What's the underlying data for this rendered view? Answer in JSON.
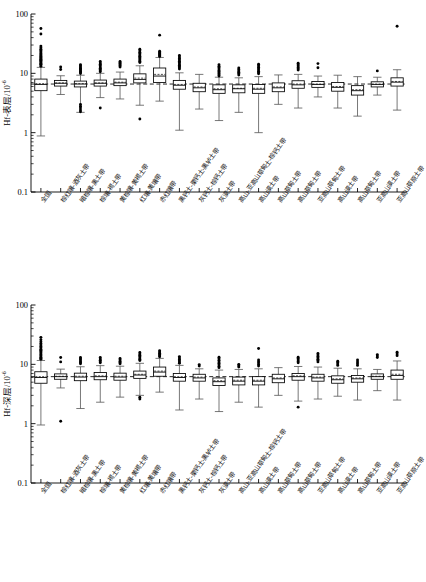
{
  "figure": {
    "type": "multi-panel-boxplot",
    "n_panels": 2,
    "n_categories": 19
  },
  "categories": [
    "全国",
    "棕红壤-酒灰土带",
    "暗棕壤-黑土带",
    "棕壤-褐土带",
    "黄棕壤-黄褐土带",
    "红壤-黄壤带",
    "赤红壤带",
    "黑钙土-栗钙土-黑垆土带",
    "灰钙土-棕钙土带",
    "灰漠土带",
    "高山-亚高山草甸土-棕钙土带",
    "高山漠土带",
    "高山草甸土带",
    "高山草甸土带",
    "亚高山草甸土带",
    "高山漠土带",
    "高山草甸土带",
    "亚高山漠土带",
    "亚高山草原土带"
  ],
  "axes": {
    "y_ticks_major": [
      "100",
      "10",
      "1",
      "0.1"
    ],
    "y_min": 0.1,
    "y_max": 100,
    "y_scale": "log",
    "y_minor_count": 8
  },
  "panels": [
    {
      "id": "panel-top",
      "ylabel_main": "Hf-表层/10",
      "ylabel_exp": "-6",
      "reference_line": 6.6,
      "chart_data": {
        "type": "box",
        "title": "",
        "xlabel": "",
        "ylabel": "Hf-表层/10-6",
        "ylim": [
          0.1,
          100
        ],
        "yscale": "log",
        "grid": false,
        "legend": "none",
        "reference_line_value": 6.6,
        "boxes": [
          {
            "cat": "全国",
            "min": 0.88,
            "q1": 5.1,
            "median": 6.5,
            "mean": 6.7,
            "q3": 8.0,
            "max": 12.6,
            "outliers": [
              13.2,
              13.8,
              14.2,
              14.6,
              15.1,
              15.6,
              16.1,
              16.6,
              17.2,
              17.8,
              18.4,
              19.0,
              19.6,
              20.4,
              21.2,
              22.0,
              23.0,
              24.2,
              25.5,
              27.0,
              28.8,
              46.0,
              57.0
            ]
          },
          {
            "cat": "棕红壤-酒灰土带",
            "min": 4.4,
            "q1": 6.1,
            "median": 6.8,
            "mean": 6.9,
            "q3": 7.6,
            "max": 9.1,
            "outliers": [
              11.6,
              12.8
            ]
          },
          {
            "cat": "暗棕壤-黑土带",
            "min": 2.2,
            "q1": 5.9,
            "median": 6.6,
            "mean": 6.7,
            "q3": 7.4,
            "max": 9.3,
            "outliers": [
              2.25,
              2.4,
              2.6,
              2.8,
              3.0,
              9.9,
              10.4,
              10.8,
              11.2,
              11.7,
              12.2,
              12.8,
              13.4,
              14.0
            ]
          },
          {
            "cat": "棕壤-褐土带",
            "min": 3.9,
            "q1": 6.1,
            "median": 6.8,
            "mean": 6.9,
            "q3": 7.7,
            "max": 10.0,
            "outliers": [
              2.6,
              10.6,
              11.1,
              11.6,
              12.2,
              12.8,
              13.5,
              14.2,
              15.0,
              15.8
            ]
          },
          {
            "cat": "黄棕壤-黄褐土带",
            "min": 3.7,
            "q1": 6.2,
            "median": 6.9,
            "mean": 7.1,
            "q3": 8.0,
            "max": 10.5,
            "outliers": [
              12.8,
              13.4,
              14.0,
              14.6,
              15.2,
              15.8
            ]
          },
          {
            "cat": "红壤-黄壤带",
            "min": 2.9,
            "q1": 6.9,
            "median": 7.9,
            "mean": 8.3,
            "q3": 9.8,
            "max": 13.4,
            "outliers": [
              1.7,
              15.2,
              16.0,
              16.8,
              17.6,
              18.5,
              19.4,
              20.4,
              21.5,
              22.7,
              24.0,
              25.5
            ]
          },
          {
            "cat": "赤红壤带",
            "min": 3.4,
            "q1": 7.0,
            "median": 9.0,
            "mean": 9.6,
            "q3": 12.3,
            "max": 18.5,
            "outliers": [
              19.2,
              20.0,
              20.8,
              21.6,
              22.5,
              23.5,
              44.0
            ]
          },
          {
            "cat": "黑钙土-栗钙土-黑垆土带",
            "min": 1.1,
            "q1": 5.4,
            "median": 6.3,
            "mean": 6.5,
            "q3": 7.6,
            "max": 10.2,
            "outliers": [
              11.8,
              12.4,
              13.0,
              13.7,
              14.4,
              15.2,
              16.0,
              16.9,
              17.8,
              18.8,
              20.0
            ]
          },
          {
            "cat": "灰钙土-棕钙土带",
            "min": 2.5,
            "q1": 4.9,
            "median": 5.7,
            "mean": 5.9,
            "q3": 6.8,
            "max": 9.6,
            "outliers": []
          },
          {
            "cat": "灰漠土带",
            "min": 1.6,
            "q1": 4.6,
            "median": 5.3,
            "mean": 5.5,
            "q3": 6.4,
            "max": 8.6,
            "outliers": [
              9.0,
              9.4,
              9.8,
              10.2,
              10.7,
              11.2,
              11.8,
              12.5,
              13.2,
              14.0
            ]
          },
          {
            "cat": "高山-亚高山草甸土-棕钙土带",
            "min": 2.2,
            "q1": 4.7,
            "median": 5.5,
            "mean": 5.6,
            "q3": 6.4,
            "max": 8.4,
            "outliers": [
              9.4,
              9.9,
              10.4,
              11.0,
              11.6,
              12.3
            ]
          },
          {
            "cat": "高山漠土带",
            "min": 1.0,
            "q1": 4.6,
            "median": 5.4,
            "mean": 5.6,
            "q3": 6.5,
            "max": 8.8,
            "outliers": [
              9.8,
              10.3,
              10.8,
              11.4,
              12.0,
              12.7,
              13.4,
              14.2
            ]
          },
          {
            "cat": "高山草甸土带",
            "min": 3.0,
            "q1": 4.9,
            "median": 5.7,
            "mean": 5.9,
            "q3": 6.9,
            "max": 9.4,
            "outliers": []
          },
          {
            "cat": "高山草甸土带",
            "min": 2.6,
            "q1": 5.6,
            "median": 6.4,
            "mean": 6.6,
            "q3": 7.5,
            "max": 9.6,
            "outliers": [
              11.4,
              12.0,
              12.6,
              13.3,
              14.0,
              14.8
            ]
          },
          {
            "cat": "亚高山草甸土带",
            "min": 4.0,
            "q1": 5.8,
            "median": 6.5,
            "mean": 6.6,
            "q3": 7.3,
            "max": 9.0,
            "outliers": [
              12.4,
              14.6
            ]
          },
          {
            "cat": "高山漠土带",
            "min": 2.6,
            "q1": 5.0,
            "median": 5.8,
            "mean": 6.0,
            "q3": 7.0,
            "max": 9.3,
            "outliers": []
          },
          {
            "cat": "高山草甸土带",
            "min": 1.9,
            "q1": 4.3,
            "median": 5.1,
            "mean": 5.3,
            "q3": 6.2,
            "max": 8.8,
            "outliers": []
          },
          {
            "cat": "亚高山漠土带",
            "min": 4.3,
            "q1": 5.9,
            "median": 6.5,
            "mean": 6.6,
            "q3": 7.2,
            "max": 8.6,
            "outliers": [
              11.0
            ]
          },
          {
            "cat": "亚高山草原土带",
            "min": 2.4,
            "q1": 6.1,
            "median": 7.1,
            "mean": 7.3,
            "q3": 8.4,
            "max": 11.5,
            "outliers": [
              62.0
            ]
          }
        ]
      }
    },
    {
      "id": "panel-bottom",
      "ylabel_main": "Hf-深层/10",
      "ylabel_exp": "-6",
      "reference_line": 6.2,
      "chart_data": {
        "type": "box",
        "title": "",
        "xlabel": "",
        "ylabel": "Hf-深层/10-6",
        "ylim": [
          0.1,
          100
        ],
        "yscale": "log",
        "grid": false,
        "legend": "none",
        "reference_line_value": 6.2,
        "boxes": [
          {
            "cat": "全国",
            "min": 0.95,
            "q1": 4.8,
            "median": 6.0,
            "mean": 6.2,
            "q3": 7.5,
            "max": 11.6,
            "outliers": [
              12.2,
              12.7,
              13.2,
              13.8,
              14.4,
              15.0,
              15.7,
              16.4,
              17.2,
              18.0,
              19.0,
              20.0,
              21.2,
              22.5,
              24.0,
              26.0,
              28.5
            ]
          },
          {
            "cat": "棕红壤-酒灰土带",
            "min": 4.0,
            "q1": 5.6,
            "median": 6.2,
            "mean": 6.3,
            "q3": 6.9,
            "max": 8.3,
            "outliers": [
              1.1,
              11.0,
              13.0
            ]
          },
          {
            "cat": "暗棕壤-黑土带",
            "min": 1.8,
            "q1": 5.3,
            "median": 6.1,
            "mean": 6.3,
            "q3": 7.1,
            "max": 9.1,
            "outliers": [
              10.2,
              10.7,
              11.2,
              11.8,
              12.4,
              13.1
            ]
          },
          {
            "cat": "棕壤-褐土带",
            "min": 2.3,
            "q1": 5.5,
            "median": 6.2,
            "mean": 6.4,
            "q3": 7.3,
            "max": 9.5,
            "outliers": [
              10.6,
              11.1,
              11.7,
              12.3,
              13.0
            ]
          },
          {
            "cat": "黄棕壤-黄褐土带",
            "min": 2.8,
            "q1": 5.4,
            "median": 6.1,
            "mean": 6.3,
            "q3": 7.1,
            "max": 9.3,
            "outliers": [
              10.2,
              10.7,
              11.3,
              11.9,
              12.6
            ]
          },
          {
            "cat": "红壤-黄壤带",
            "min": 3.0,
            "q1": 5.8,
            "median": 6.6,
            "mean": 6.8,
            "q3": 7.7,
            "max": 10.4,
            "outliers": [
              2.6,
              2.8,
              11.6,
              12.2,
              12.8,
              13.5,
              14.2,
              15.0,
              15.9
            ]
          },
          {
            "cat": "赤红壤带",
            "min": 3.4,
            "q1": 6.3,
            "median": 7.4,
            "mean": 7.7,
            "q3": 9.0,
            "max": 12.6,
            "outliers": [
              13.4,
              14.0,
              14.7,
              15.4,
              16.2,
              17.0
            ]
          },
          {
            "cat": "黑钙土-栗钙土-黑垆土带",
            "min": 1.7,
            "q1": 5.2,
            "median": 6.0,
            "mean": 6.2,
            "q3": 7.0,
            "max": 9.6,
            "outliers": [
              10.4,
              10.9,
              11.5,
              12.1,
              12.8,
              13.5
            ]
          },
          {
            "cat": "灰钙土-棕钙土带",
            "min": 2.6,
            "q1": 5.2,
            "median": 5.9,
            "mean": 6.1,
            "q3": 6.8,
            "max": 8.4,
            "outliers": [
              9.4,
              9.9
            ]
          },
          {
            "cat": "灰漠土带",
            "min": 1.6,
            "q1": 4.4,
            "median": 5.1,
            "mean": 5.3,
            "q3": 5.9,
            "max": 8.0,
            "outliers": [
              8.8,
              9.3,
              9.8,
              10.4,
              11.0,
              11.7,
              12.4,
              13.2
            ]
          },
          {
            "cat": "高山-亚高山草甸土-棕钙土带",
            "min": 2.3,
            "q1": 4.5,
            "median": 5.2,
            "mean": 5.4,
            "q3": 6.1,
            "max": 8.2,
            "outliers": [
              9.0,
              9.5,
              10.0
            ]
          },
          {
            "cat": "高山漠土带",
            "min": 1.9,
            "q1": 4.5,
            "median": 5.2,
            "mean": 5.4,
            "q3": 6.2,
            "max": 8.4,
            "outliers": [
              9.4,
              9.9,
              10.5,
              11.1,
              11.8,
              18.5
            ]
          },
          {
            "cat": "高山草甸土带",
            "min": 3.0,
            "q1": 4.9,
            "median": 5.7,
            "mean": 5.9,
            "q3": 6.8,
            "max": 8.8,
            "outliers": []
          },
          {
            "cat": "高山草甸土带",
            "min": 2.4,
            "q1": 5.4,
            "median": 6.2,
            "mean": 6.4,
            "q3": 7.0,
            "max": 9.2,
            "outliers": [
              1.9,
              10.6,
              11.2,
              11.8,
              12.5,
              13.2
            ]
          },
          {
            "cat": "亚高山草甸土带",
            "min": 2.6,
            "q1": 5.2,
            "median": 5.9,
            "mean": 6.1,
            "q3": 6.8,
            "max": 9.0,
            "outliers": [
              11.0,
              11.6,
              12.2,
              12.9,
              13.6,
              14.4,
              15.2
            ]
          },
          {
            "cat": "高山漠土带",
            "min": 2.9,
            "q1": 4.8,
            "median": 5.5,
            "mean": 5.7,
            "q3": 6.4,
            "max": 8.6,
            "outliers": [
              9.6,
              10.1,
              10.7,
              11.3
            ]
          },
          {
            "cat": "高山草甸土带",
            "min": 2.5,
            "q1": 5.0,
            "median": 5.7,
            "mean": 5.9,
            "q3": 6.5,
            "max": 8.4,
            "outliers": [
              9.6,
              10.2,
              11.0,
              11.8
            ]
          },
          {
            "cat": "亚高山漠土带",
            "min": 3.6,
            "q1": 5.6,
            "median": 6.2,
            "mean": 6.3,
            "q3": 6.9,
            "max": 8.2,
            "outliers": [
              13.0,
              13.8,
              14.6
            ]
          },
          {
            "cat": "亚高山草原土带",
            "min": 2.5,
            "q1": 5.6,
            "median": 6.5,
            "mean": 6.8,
            "q3": 8.0,
            "max": 11.4,
            "outliers": [
              14.0,
              15.0,
              16.0
            ]
          }
        ]
      }
    }
  ]
}
